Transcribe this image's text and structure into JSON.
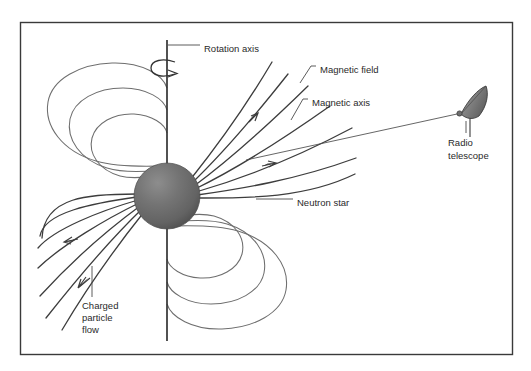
{
  "figure": {
    "background_color": "#ffffff",
    "border_color": "#3a3a3a",
    "border": {
      "x": 20,
      "y": 22,
      "width": 493,
      "height": 333
    }
  },
  "colors": {
    "text": "#2a2a2a",
    "field_line_closed": "#6e6e6e",
    "field_line_open": "#3d3d3d",
    "axis": "#333333",
    "leader": "#4a4a4a",
    "star_fill": "#6b6b6b",
    "star_highlight": "#8a8a8a",
    "star_shadow": "#4f4f4f",
    "dish_fill": "#808080",
    "dish_edge": "#3a3a3a"
  },
  "labels": {
    "rotation_axis": {
      "text": "Rotation axis",
      "x": 204,
      "y": 49,
      "anchor": "start"
    },
    "magnetic_field": {
      "text": "Magnetic field",
      "x": 320,
      "y": 70,
      "anchor": "start"
    },
    "magnetic_axis": {
      "text": "Magnetic axis",
      "x": 312,
      "y": 103,
      "anchor": "start"
    },
    "neutron_star": {
      "text": "Neutron star",
      "x": 297,
      "y": 203,
      "anchor": "start"
    },
    "radio_telescope": {
      "lines": [
        "Radio",
        "telescope"
      ],
      "x": 448,
      "y": 143,
      "anchor": "start",
      "line_height": 13
    },
    "charged_particle_flow": {
      "lines": [
        "Charged",
        "particle",
        "flow"
      ],
      "x": 82,
      "y": 306,
      "anchor": "start",
      "line_height": 12
    }
  },
  "elements": {
    "neutron_star": {
      "name": "neutron-star-sphere",
      "cx": 167,
      "cy": 196,
      "r": 33
    },
    "rotation_axis": {
      "name": "rotation-axis-line",
      "x": 167,
      "y_top": 40,
      "y_bottom": 341
    },
    "rotation_arrow": {
      "name": "rotation-direction-arrow",
      "cx": 167,
      "cy": 68,
      "rx": 15,
      "ry": 6
    },
    "radio_telescope": {
      "name": "radio-telescope-dish",
      "feed_x": 459,
      "feed_y": 113,
      "post_bottom_y": 137
    },
    "line_of_sight": {
      "name": "line-of-sight-beam",
      "x1": 250,
      "y1": 158,
      "x2": 458,
      "y2": 114
    }
  },
  "counts": {
    "closed_loops_per_side": 3,
    "open_field_lines_per_beam": 7,
    "arrowheads_upper_beam": 2,
    "arrowheads_lower_beam": 2
  }
}
